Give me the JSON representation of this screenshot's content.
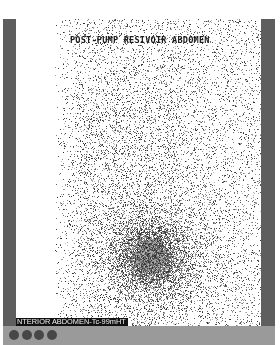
{
  "scan": {
    "title": "POST-PUMP RESIVOIR ABDOMEN",
    "label": "NTERIOR ABDOMEN-Tc-99mHT",
    "hotspot": {
      "cx": 134,
      "cy": 238,
      "rx": 32,
      "ry": 30
    }
  },
  "footer": {
    "indicators": [
      "indicator-1",
      "indicator-2",
      "indicator-3",
      "indicator-4"
    ]
  },
  "colors": {
    "frame": "#5e5e5e",
    "footer": "#9a9a9a",
    "indicator": "#474747",
    "label_bg": "#111111"
  }
}
